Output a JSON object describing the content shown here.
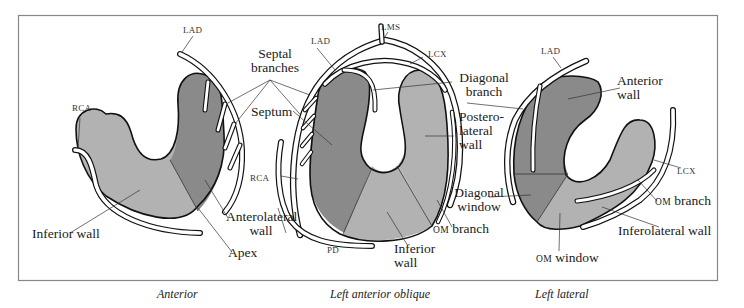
{
  "colors": {
    "dark_fill": "#8a8a8a",
    "light_fill": "#b2b2b2",
    "outline": "#111111",
    "frame": "#888888",
    "vessel_fill": "#ffffff"
  },
  "views": [
    {
      "caption": "Anterior",
      "labels": {
        "lad": "LAD",
        "rca": "RCA",
        "septal_line1": "Septal",
        "septal_line2": "branches",
        "inferior_wall": "Inferior wall",
        "anterolateral_line1": "Anterolateral",
        "anterolateral_line2": "wall",
        "apex": "Apex"
      }
    },
    {
      "caption": "Left anterior oblique",
      "labels": {
        "lad": "LAD",
        "lms": "LMS",
        "lcx": "LCX",
        "diagonal_line1": "Diagonal",
        "diagonal_line2": "branch",
        "septum": "Septum",
        "posterolateral_line1": "Postero-",
        "posterolateral_line2": "lateral",
        "posterolateral_line3": "wall",
        "rca": "RCA",
        "pd": "PD",
        "om_prefix": "OM",
        "om_branch": "branch",
        "inferior_line1": "Inferior",
        "inferior_line2": "wall"
      }
    },
    {
      "caption": "Left lateral",
      "labels": {
        "lad": "LAD",
        "anterior_line1": "Anterior",
        "anterior_line2": "wall",
        "lcx": "LCX",
        "diag_window_line1": "Diagonal",
        "diag_window_line2": "window",
        "om_prefix": "OM",
        "om_branch": "branch",
        "inferolateral_wall": "Inferolateral wall",
        "om_window": "window"
      }
    }
  ]
}
